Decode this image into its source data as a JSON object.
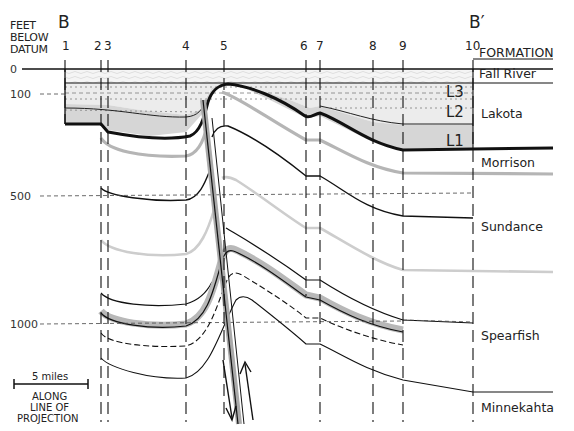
{
  "diagram": {
    "type": "geologic-cross-section",
    "section_start_label": "B",
    "section_end_label": "B′",
    "vertical_axis": {
      "title_lines": [
        "FEET",
        "BELOW",
        "DATUM"
      ],
      "ticks": [
        {
          "value": "0",
          "y": 69
        },
        {
          "value": "100",
          "y": 94
        },
        {
          "value": "500",
          "y": 196
        },
        {
          "value": "1000",
          "y": 324
        }
      ]
    },
    "wells": [
      {
        "label": "1",
        "x": 65
      },
      {
        "label": "2",
        "x": 101
      },
      {
        "label": "3",
        "x": 108
      },
      {
        "label": "4",
        "x": 186
      },
      {
        "label": "5",
        "x": 224
      },
      {
        "label": "6",
        "x": 306
      },
      {
        "label": "7",
        "x": 320
      },
      {
        "label": "8",
        "x": 373
      },
      {
        "label": "9",
        "x": 403
      },
      {
        "label": "10",
        "x": 473
      }
    ],
    "formation_header": "FORMATION",
    "formations": [
      {
        "name": "Fall River",
        "y": 73
      },
      {
        "name": "Lakota",
        "y": 118
      },
      {
        "name": "Morrison",
        "y": 164
      },
      {
        "name": "Sundance",
        "y": 230
      },
      {
        "name": "Spearfish",
        "y": 338
      },
      {
        "name": "Minnekahta",
        "y": 409
      }
    ],
    "lakota_units": [
      {
        "label": "L3",
        "x": 446,
        "y": 96
      },
      {
        "label": "L2",
        "x": 446,
        "y": 116
      },
      {
        "label": "L1",
        "x": 446,
        "y": 150
      }
    ],
    "scale_bar": {
      "label": "5 miles",
      "caption_lines": [
        "ALONG",
        "LINE OF",
        "PROJECTION"
      ]
    },
    "fault": {
      "description": "normal fault near well 5",
      "arrows": [
        "down",
        "up"
      ]
    },
    "colors": {
      "line": "#111111",
      "gray_band": "#b8b8b8",
      "light_gray_line": "#cfcfcf",
      "fill_L1": "#d6d6d6",
      "fill_L2_L3": "#ececec",
      "fill_fall_river": "#f4f4f4"
    }
  }
}
